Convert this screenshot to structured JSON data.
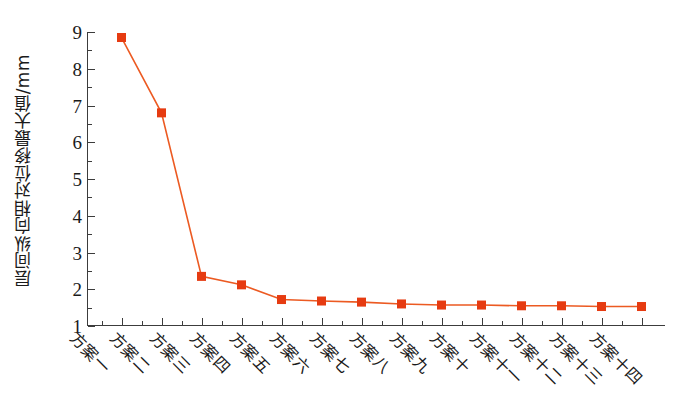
{
  "chart_data": {
    "type": "line",
    "title": "",
    "xlabel": "",
    "ylabel": "层间纵向相对位移最大值/mm",
    "ylim": [
      1,
      9
    ],
    "yticks": [
      1,
      2,
      3,
      4,
      5,
      6,
      7,
      8,
      9
    ],
    "ytick_labels": [
      "1",
      "2",
      "3",
      "4",
      "5",
      "6",
      "7",
      "8",
      "9"
    ],
    "y_minor_ticks": [
      1.5,
      2.5,
      3.5,
      4.5,
      5.5,
      6.5,
      7.5,
      8.5
    ],
    "grid": false,
    "legend": "none",
    "marker": "square",
    "marker_color": "#e63b11",
    "line_color": "#ec5a22",
    "categories": [
      "方案一",
      "方案二",
      "方案三",
      "方案四",
      "方案五",
      "方案六",
      "方案七",
      "方案八",
      "方案九",
      "方案十",
      "方案十一",
      "方案十二",
      "方案十三",
      "方案十四"
    ],
    "values": [
      8.85,
      6.8,
      2.35,
      2.12,
      1.72,
      1.68,
      1.65,
      1.6,
      1.57,
      1.57,
      1.55,
      1.55,
      1.53,
      1.53
    ]
  }
}
